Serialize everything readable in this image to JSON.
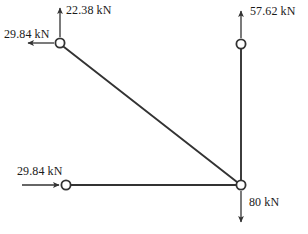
{
  "figure": {
    "type": "truss-free-body-diagram",
    "width": 308,
    "height": 234,
    "background_color": "#ffffff",
    "line_color": "#333333",
    "text_color": "#1a1a1a"
  },
  "joints": [
    {
      "id": "top-left",
      "name": "joint-top-left",
      "x": 60,
      "y": 43,
      "radius": 5
    },
    {
      "id": "top-right",
      "name": "joint-top-right",
      "x": 241,
      "y": 44,
      "radius": 5
    },
    {
      "id": "bottom-left",
      "name": "joint-bottom-left",
      "x": 66,
      "y": 185,
      "radius": 5
    },
    {
      "id": "bottom-right",
      "name": "joint-bottom-right",
      "x": 241,
      "y": 185,
      "radius": 5
    }
  ],
  "members": [
    {
      "id": "diagonal",
      "from": "top-left",
      "to": "bottom-right"
    },
    {
      "id": "vertical",
      "from": "top-right",
      "to": "bottom-right"
    },
    {
      "id": "horizontal",
      "from": "bottom-left",
      "to": "bottom-right"
    }
  ],
  "forces": {
    "top_vertical": {
      "label": "22.38 kN",
      "magnitude": 22.38,
      "unit": "kN",
      "direction": "up",
      "at_joint": "top-left"
    },
    "top_left": {
      "label": "29.84 kN",
      "magnitude": 29.84,
      "unit": "kN",
      "direction": "left",
      "at_joint": "top-left"
    },
    "top_right": {
      "label": "57.62 kN",
      "magnitude": 57.62,
      "unit": "kN",
      "direction": "up",
      "at_joint": "top-right"
    },
    "bottom_left": {
      "label": "29.84 kN",
      "magnitude": 29.84,
      "unit": "kN",
      "direction": "right",
      "at_joint": "bottom-left"
    },
    "bottom_right": {
      "label": "80 kN",
      "magnitude": 80,
      "unit": "kN",
      "direction": "down",
      "at_joint": "bottom-right"
    }
  }
}
